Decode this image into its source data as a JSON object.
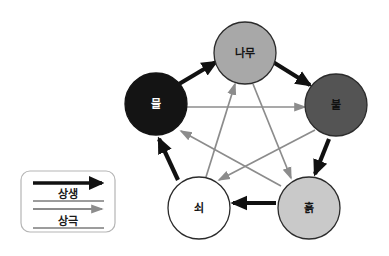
{
  "diagram": {
    "background_color": "#ffffff",
    "nodes": [
      {
        "id": "wood",
        "label": "나무",
        "cx": 245,
        "cy": 53,
        "r": 31,
        "fill": "#a8a8a8",
        "stroke": "#2b2b2b",
        "text_color": "#141414"
      },
      {
        "id": "fire",
        "label": "불",
        "cx": 336,
        "cy": 105,
        "r": 31,
        "fill": "#545454",
        "stroke": "#2b2b2b",
        "text_color": "#111111"
      },
      {
        "id": "earth",
        "label": "흙",
        "cx": 309,
        "cy": 208,
        "r": 31,
        "fill": "#c9c9c9",
        "stroke": "#2b2b2b",
        "text_color": "#141414"
      },
      {
        "id": "metal",
        "label": "쇠",
        "cx": 199,
        "cy": 208,
        "r": 31,
        "fill": "#ffffff",
        "stroke": "#2b2b2b",
        "text_color": "#141414"
      },
      {
        "id": "water",
        "label": "물",
        "cx": 156,
        "cy": 104,
        "r": 31,
        "fill": "#141414",
        "stroke": "#141414",
        "text_color": "#ffffff"
      }
    ],
    "generating_cycle": {
      "name": "상생",
      "color": "#111111",
      "stroke_width": 4.2,
      "edges": [
        {
          "from": "water",
          "to": "wood",
          "x1": 179,
          "y1": 84,
          "x2": 216,
          "y2": 62
        },
        {
          "from": "wood",
          "to": "fire",
          "x1": 273,
          "y1": 62,
          "x2": 310,
          "y2": 85
        },
        {
          "from": "fire",
          "to": "earth",
          "x1": 329,
          "y1": 139,
          "x2": 315,
          "y2": 174
        },
        {
          "from": "earth",
          "to": "metal",
          "x1": 276,
          "y1": 203,
          "x2": 233,
          "y2": 203
        },
        {
          "from": "metal",
          "to": "water",
          "x1": 178,
          "y1": 180,
          "x2": 159,
          "y2": 139
        }
      ]
    },
    "overcoming_cycle": {
      "name": "상극",
      "color": "#8c8c8c",
      "stroke_width": 1.7,
      "edges": [
        {
          "from": "water",
          "to": "fire",
          "x1": 186,
          "y1": 107,
          "x2": 305,
          "y2": 107
        },
        {
          "from": "fire",
          "to": "metal",
          "x1": 315,
          "y1": 130,
          "x2": 219,
          "y2": 180
        },
        {
          "from": "metal",
          "to": "wood",
          "x1": 206,
          "y1": 177,
          "x2": 235,
          "y2": 84
        },
        {
          "from": "wood",
          "to": "earth",
          "x1": 253,
          "y1": 84,
          "x2": 291,
          "y2": 178
        },
        {
          "from": "earth",
          "to": "water",
          "x1": 281,
          "y1": 186,
          "x2": 181,
          "y2": 131
        }
      ]
    },
    "legend": {
      "box": {
        "x": 21,
        "y": 171,
        "width": 94,
        "height": 61,
        "radius": 9,
        "stroke": "#b5b5b5",
        "fill": "#ffffff"
      },
      "rows": [
        {
          "id": "generating",
          "label": "상생",
          "arrow_color": "#111111",
          "arrow_width": 3.6,
          "arrow_x1": 33,
          "arrow_x2": 102,
          "arrow_y": 183,
          "label_x": 68,
          "label_y": 194
        },
        {
          "id": "overcoming",
          "label": "상극",
          "arrow_color": "#8c8c8c",
          "arrow_width": 1.8,
          "arrow_x1": 33,
          "arrow_x2": 102,
          "arrow_y": 209,
          "label_x": 68,
          "label_y": 221
        }
      ],
      "divider_color": "#3a3a3a"
    }
  }
}
